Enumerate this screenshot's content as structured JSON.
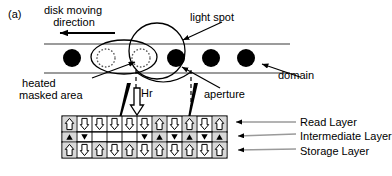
{
  "figure": {
    "panel_letter": "(a)",
    "labels": {
      "disk_moving_direction": "disk moving\n   direction",
      "light_spot": "light spot",
      "heated_masked_area": " heated\nmasked area",
      "hr_field": "Hr",
      "aperture": "aperture",
      "domain": "domain",
      "read_layer": "Read Layer",
      "intermediate_layer": "Intermediate Layer",
      "storage_layer": "Storage Layer"
    },
    "colors": {
      "ink": "#000000",
      "domain_fill": "#000000",
      "cell_fill": "#d8d8d8",
      "dashed": "#000000"
    }
  },
  "track": {
    "domains": [
      {
        "cx": 72,
        "r": 9,
        "state": "written",
        "style": "solid"
      },
      {
        "cx": 106,
        "r": 9,
        "state": "erased",
        "style": "dotted"
      },
      {
        "cx": 141,
        "r": 9,
        "state": "erased",
        "style": "dotted"
      },
      {
        "cx": 176,
        "r": 9,
        "state": "written",
        "style": "solid"
      },
      {
        "cx": 211,
        "r": 9,
        "state": "written",
        "style": "solid"
      },
      {
        "cx": 246,
        "r": 9,
        "state": "written",
        "style": "solid"
      }
    ],
    "light_spot": {
      "cx": 157,
      "cy": 51,
      "r": 28
    },
    "mask_ellipse": {
      "cx": 124,
      "cy": 57,
      "rx": 33,
      "ry": 17
    },
    "aperture_x_left": 136,
    "aperture_x_right": 191
  },
  "layers": {
    "grid_left": 62,
    "grid_right": 227,
    "columns": 11,
    "read": {
      "name": "Read Layer",
      "arrows": [
        "up",
        "down",
        "down",
        "down",
        "down",
        "down",
        "up",
        "down",
        "up",
        "down",
        "up"
      ]
    },
    "intermediate": {
      "name": "Intermediate Layer",
      "arrows": [
        "up",
        "down",
        "none",
        "none",
        "none",
        "down",
        "up",
        "down",
        "up",
        "down",
        "up"
      ]
    },
    "storage": {
      "name": "Storage Layer",
      "arrows": [
        "up",
        "down",
        "up",
        "down",
        "up",
        "down",
        "up",
        "down",
        "up",
        "down",
        "up"
      ]
    }
  }
}
